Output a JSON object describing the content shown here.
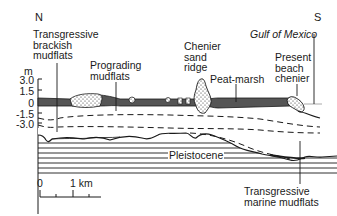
{
  "figure": {
    "direction_left": "N",
    "direction_right": "S",
    "sea_label": "Gulf of Mexico",
    "axis": {
      "unit": "m",
      "ticks": [
        "3.0",
        "1.5",
        "0",
        "-1.5",
        "-3.0"
      ]
    },
    "labels": {
      "transgressive_brackish": "Transgressive\nbrackish\nmudflats",
      "prograding": "Prograding\nmudflats",
      "chenier_ridge": "Chenier\nsand\nridge",
      "peat_marsh": "Peat-marsh",
      "present_beach": "Present\nbeach\nchenier",
      "pleistocene": "Pleistocene",
      "transgressive_marine": "Transgressive\nmarine mudflats"
    },
    "scale_bar": {
      "start": "0",
      "end": "1 km"
    }
  },
  "colors": {
    "ink": "#1a1a1a",
    "marsh_fill": "#555555",
    "sand_fill": "#ffffff",
    "water_line": "#aaaaaa"
  }
}
